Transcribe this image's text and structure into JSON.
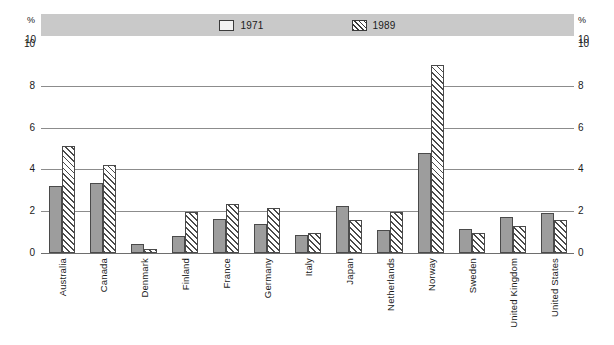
{
  "chart_data": {
    "type": "bar",
    "title": "",
    "xlabel": "",
    "ylabel": "%",
    "ylim": [
      0,
      10
    ],
    "yticks": [
      0,
      2,
      4,
      6,
      8,
      10
    ],
    "grid": true,
    "legend_position": "top-center",
    "axis_unit_label": "%",
    "axis_top_label": "10",
    "categories": [
      "Australia",
      "Canada",
      "Denmark",
      "Finland",
      "France",
      "Germany",
      "Italy",
      "Japan",
      "Netherlands",
      "Norway",
      "Sweden",
      "United Kingdom",
      "United States"
    ],
    "series": [
      {
        "name": "1971",
        "fill": "solid-gray",
        "color": "#9d9d9d",
        "values": [
          3.2,
          3.35,
          0.45,
          0.8,
          1.65,
          1.4,
          0.85,
          2.25,
          1.1,
          4.8,
          1.15,
          1.7,
          1.9
        ]
      },
      {
        "name": "1989",
        "fill": "diagonal-hatch",
        "color": "#4a4a4a",
        "values": [
          5.1,
          4.2,
          0.2,
          1.95,
          2.35,
          2.15,
          0.95,
          1.6,
          1.95,
          9.0,
          0.95,
          1.3,
          1.6
        ]
      }
    ]
  },
  "legend": {
    "items": [
      {
        "label": "1971",
        "swatch": "legend-swatch-solid"
      },
      {
        "label": "1989",
        "swatch": "legend-swatch-hatched"
      }
    ]
  },
  "axis": {
    "left_percent": "%",
    "right_percent": "%",
    "left_top": "10",
    "right_top": "10"
  },
  "colors": {
    "legend_band": "#c9c9c9",
    "bar_1971": "#9d9d9d",
    "bar_1989_stroke": "#4a4a4a",
    "gridline": "#8c8c8c",
    "text": "#1a1a1a",
    "background": "#ffffff"
  }
}
